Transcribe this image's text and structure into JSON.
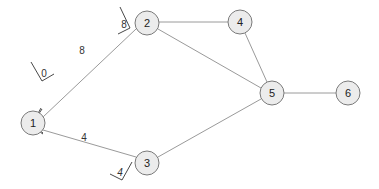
{
  "diagram": {
    "type": "weighted-graph",
    "nodes": [
      {
        "id": "1",
        "label": "1",
        "x": 33,
        "y": 123
      },
      {
        "id": "2",
        "label": "2",
        "x": 147,
        "y": 23
      },
      {
        "id": "3",
        "label": "3",
        "x": 147,
        "y": 163
      },
      {
        "id": "4",
        "label": "4",
        "x": 240,
        "y": 22
      },
      {
        "id": "5",
        "label": "5",
        "x": 272,
        "y": 93
      },
      {
        "id": "6",
        "label": "6",
        "x": 348,
        "y": 93
      }
    ],
    "edges": [
      {
        "from": "1",
        "to": "2",
        "weight": "8",
        "start_tag": "0",
        "end_tag": "8"
      },
      {
        "from": "1",
        "to": "3",
        "weight": "4",
        "start_tag": "0",
        "end_tag": "4"
      },
      {
        "from": "2",
        "to": "4"
      },
      {
        "from": "2",
        "to": "5"
      },
      {
        "from": "3",
        "to": "5"
      },
      {
        "from": "4",
        "to": "5"
      },
      {
        "from": "5",
        "to": "6"
      }
    ],
    "labels": {
      "edge_1_2_weight": "8",
      "edge_1_2_start": "0",
      "edge_1_2_end": "8",
      "edge_1_3_weight": "4",
      "edge_1_3_start": "0",
      "edge_1_3_end": "4"
    },
    "colors": {
      "edge": "#9a9a9a",
      "node_fill": "#ececec",
      "node_stroke": "#7a7a7a",
      "text": "#222222"
    }
  }
}
